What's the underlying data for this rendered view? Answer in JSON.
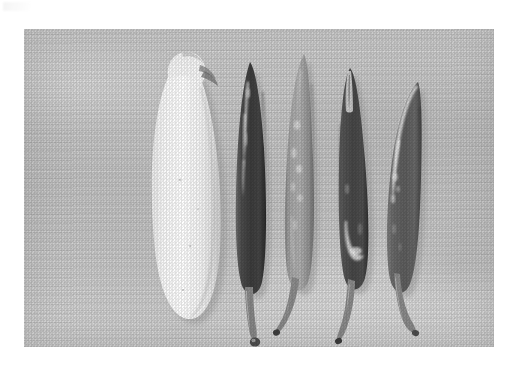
{
  "page": {
    "background_color": "#ffffff",
    "corner_mark": "faint-gray-smudge"
  },
  "photo": {
    "caption": "",
    "alt": "Five chili peppers arranged side by side on a wooden cutting board, photographed from above in black and white",
    "subject": "chili-peppers",
    "surface": "wooden-cutting-board",
    "surface_color": "#c7c7c5",
    "color_mode": "grayscale",
    "frame": {
      "x": 24,
      "y": 29,
      "width": 470,
      "height": 318
    },
    "items": [
      {
        "index": 1,
        "name": "white-pepper",
        "label": "White chili pepper",
        "tone": "white",
        "body_color": "#f4f3ef",
        "shadow_color": "#a9a8a4",
        "orientation": "stem-up",
        "tip_detail": "cut-broken-stem",
        "surface": "matte",
        "relative_width": "widest"
      },
      {
        "index": 2,
        "name": "dark-pepper-left",
        "label": "Dark chili pepper",
        "tone": "very-dark",
        "body_color": "#4a4844",
        "shadow_color": "#8e8d89",
        "orientation": "stem-down",
        "tip_detail": "curved-stem-with-bulb-tip",
        "surface": "glossy-highlight",
        "relative_width": "slim"
      },
      {
        "index": 3,
        "name": "light-gray-pepper",
        "label": "Light chili pepper",
        "tone": "mid-light",
        "body_color": "#9d9c97",
        "shadow_color": "#8a8985",
        "orientation": "stem-down",
        "tip_detail": "hooked-stem",
        "surface": "mottled-specular",
        "relative_width": "medium"
      },
      {
        "index": 4,
        "name": "dark-pepper-right",
        "label": "Dark chili pepper",
        "tone": "very-dark",
        "body_color": "#53514d",
        "shadow_color": "#8e8d89",
        "orientation": "stem-down",
        "tip_detail": "hooked-stem",
        "surface": "glossy-highlight",
        "relative_width": "medium"
      },
      {
        "index": 5,
        "name": "curved-pepper",
        "label": "Curved chili pepper",
        "tone": "mid-dark",
        "body_color": "#6e6c68",
        "shadow_color": "#8e8d89",
        "orientation": "stem-down",
        "tip_detail": "long-curved-stem",
        "surface": "bright-edge-highlight",
        "relative_width": "slim-curved"
      }
    ],
    "item_count": 5
  }
}
